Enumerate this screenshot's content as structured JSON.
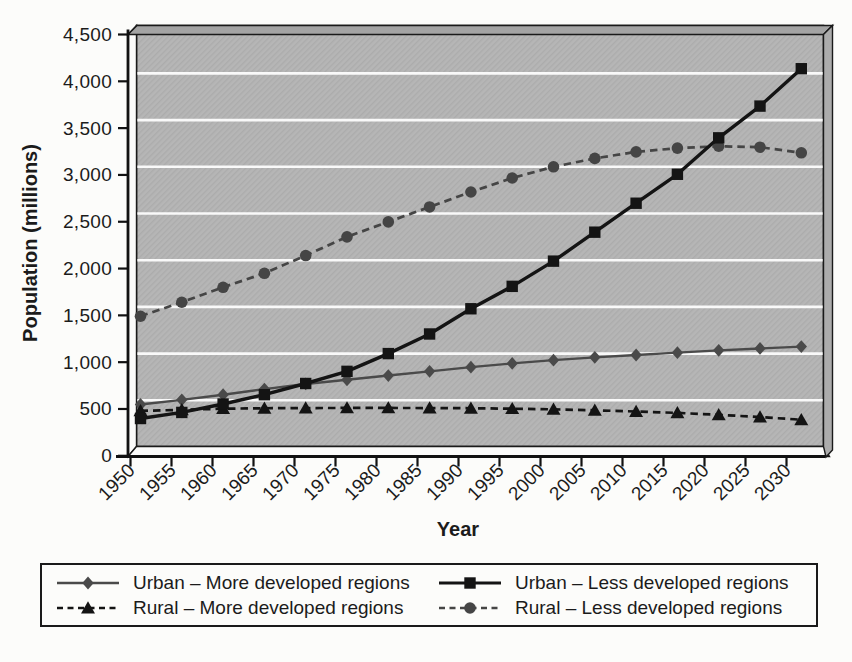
{
  "chart_data": {
    "type": "line",
    "title": "",
    "xlabel": "Year",
    "ylabel": "Population (millions)",
    "x": [
      1950,
      1955,
      1960,
      1965,
      1970,
      1975,
      1980,
      1985,
      1990,
      1995,
      2000,
      2005,
      2010,
      2015,
      2020,
      2025,
      2030
    ],
    "xtick_labels": [
      "1950",
      "1955",
      "1960",
      "1965",
      "1970",
      "1975",
      "1980",
      "1985",
      "1990",
      "1995",
      "2000",
      "2005",
      "2010",
      "2015",
      "2020",
      "2025",
      "2030"
    ],
    "ylim": [
      0,
      4500
    ],
    "ytick_step": 500,
    "ytick_labels": [
      "0",
      "500",
      "1,000",
      "1,500",
      "2,000",
      "2,500",
      "3,000",
      "3,500",
      "4,000",
      "4,500"
    ],
    "grid": true,
    "gridline_color": "#ffffff",
    "wall_color": "#b6b6b6",
    "legend_position": "bottom",
    "series": [
      {
        "name": "Urban – More developed regions",
        "marker": "diamond",
        "line_style": "solid",
        "color": "#4a4a4a",
        "line_width": 2.4,
        "values": [
          455,
          505,
          560,
          620,
          675,
          720,
          765,
          810,
          855,
          895,
          930,
          960,
          985,
          1010,
          1035,
          1055,
          1075
        ]
      },
      {
        "name": "Urban – Less developed regions",
        "marker": "square",
        "line_style": "solid",
        "color": "#141414",
        "line_width": 3.4,
        "values": [
          305,
          370,
          460,
          560,
          680,
          810,
          1000,
          1210,
          1480,
          1720,
          1990,
          2300,
          2610,
          2920,
          3310,
          3650,
          4050
        ]
      },
      {
        "name": "Rural – More developed regions",
        "marker": "triangle",
        "line_style": "dashed",
        "color": "#141414",
        "line_width": 2.7,
        "values": [
          387,
          398,
          410,
          415,
          417,
          418,
          418,
          417,
          415,
          410,
          403,
          393,
          380,
          365,
          345,
          320,
          292
        ]
      },
      {
        "name": "Rural – Less developed regions",
        "marker": "circle",
        "line_style": "dashed",
        "color": "#454545",
        "line_width": 2.7,
        "values": [
          1400,
          1550,
          1710,
          1860,
          2050,
          2250,
          2410,
          2570,
          2730,
          2880,
          3000,
          3090,
          3160,
          3200,
          3220,
          3210,
          3150
        ]
      }
    ]
  }
}
